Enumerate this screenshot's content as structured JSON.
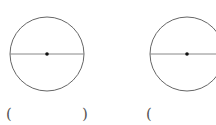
{
  "figures": [
    {
      "name": "circle-left",
      "center": [
        47,
        54
      ],
      "radius": 37,
      "line": "diameter",
      "answer_blank": {
        "open": "(",
        "close": ")"
      }
    },
    {
      "name": "circle-right",
      "center": [
        187,
        54
      ],
      "radius": 37,
      "line": "radius",
      "answer_blank": {
        "open": "(",
        "close": ""
      }
    }
  ],
  "colors": {
    "stroke": "#666666",
    "line": "#888888",
    "dot": "#111111"
  }
}
